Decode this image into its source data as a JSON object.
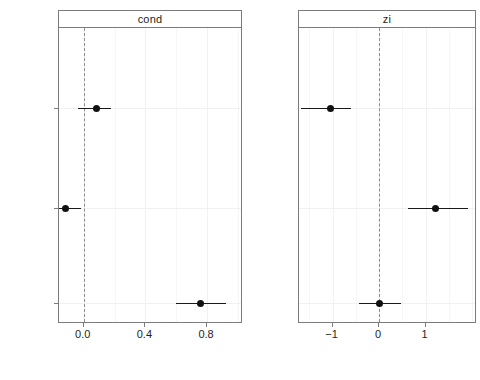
{
  "chart_data": {
    "type": "scatter",
    "title": "",
    "xlabel": "",
    "ylabel": "",
    "grid": true,
    "legend_position": "none",
    "plot_style": "coefficient-forest-plot",
    "terms": [
      "Precip",
      "Breeding\nDensity",
      "(Intercept)"
    ],
    "panels": [
      {
        "name": "cond",
        "label": "cond",
        "xlim": [
          -0.16,
          1.02
        ],
        "xticks": [
          0.0,
          0.4,
          0.8
        ],
        "xtick_labels": [
          "0.0",
          "0.4",
          "0.8"
        ],
        "zero_reference": 0.0,
        "points": [
          {
            "term": "Precip",
            "estimate": 0.08,
            "ci_low": -0.04,
            "ci_high": 0.18
          },
          {
            "term": "Breeding Density",
            "estimate": -0.12,
            "ci_low": -0.25,
            "ci_high": -0.02
          },
          {
            "term": "(Intercept)",
            "estimate": 0.76,
            "ci_low": 0.6,
            "ci_high": 0.92
          }
        ]
      },
      {
        "name": "zi",
        "label": "zi",
        "xlim": [
          -1.72,
          2.06
        ],
        "xticks": [
          -1,
          0,
          1
        ],
        "xtick_labels": [
          "−1",
          "0",
          "1"
        ],
        "zero_reference": 0,
        "points": [
          {
            "term": "Precip",
            "estimate": -1.04,
            "ci_low": -1.67,
            "ci_high": -0.6
          },
          {
            "term": "Breeding Density",
            "estimate": 1.22,
            "ci_low": 0.62,
            "ci_high": 1.91
          },
          {
            "term": "(Intercept)",
            "estimate": 0.0,
            "ci_low": -0.44,
            "ci_high": 0.47
          }
        ]
      }
    ]
  },
  "axis": {
    "y_labels": [
      "Precip",
      "Breeding\nDensity",
      "(Intercept)"
    ]
  },
  "colors": {
    "point": "#111111",
    "ci_line": "#1a1a1a",
    "zero_line": "#8d8d8d",
    "panel_border": "#7b7b7b",
    "grid": "#f1f1f1",
    "background": "#ffffff",
    "text": "#231f20"
  }
}
